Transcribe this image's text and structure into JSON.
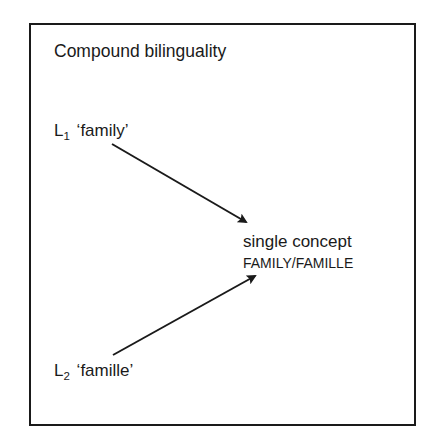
{
  "diagram": {
    "title": "Compound bilinguality",
    "nodes": [
      {
        "id": "l1",
        "letter": "L",
        "subscript": "1",
        "word": "‘family’"
      },
      {
        "id": "l2",
        "letter": "L",
        "subscript": "2",
        "word": "‘famille’"
      },
      {
        "id": "concept",
        "line1": "single concept",
        "line2": "FAMILY/FAMILLE"
      }
    ],
    "edges": [
      {
        "from": "l1",
        "to": "concept",
        "x1": 112,
        "y1": 144,
        "x2": 246,
        "y2": 222
      },
      {
        "from": "l2",
        "to": "concept",
        "x1": 113,
        "y1": 355,
        "x2": 255,
        "y2": 276
      }
    ],
    "colors": {
      "stroke": "#1a1a1a",
      "background": "#ffffff"
    }
  }
}
